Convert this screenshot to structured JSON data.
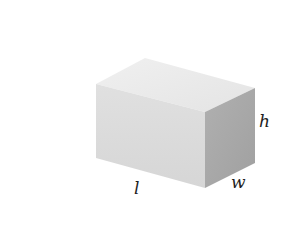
{
  "diagram": {
    "labels": {
      "height": "h",
      "length": "l",
      "width": "w"
    },
    "colors": {
      "background": "#ffffff",
      "top_face": "#ebebeb",
      "front_face": "#dcdcdc",
      "side_face": "#a8a8a8",
      "label_text": "#1e1e1e"
    }
  }
}
